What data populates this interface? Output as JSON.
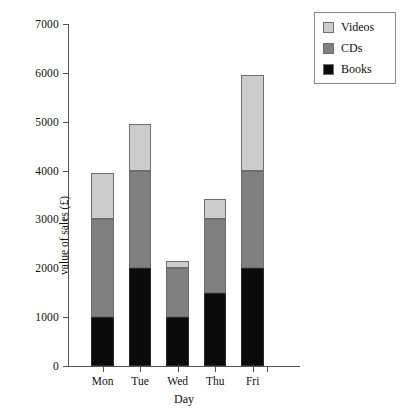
{
  "chart_data": {
    "type": "bar",
    "subtype": "stacked-bar",
    "title": "",
    "xlabel": "Day",
    "ylabel": "value of sales (£)",
    "categories": [
      "Mon",
      "Tue",
      "Wed",
      "Thu",
      "Fri"
    ],
    "ylim": [
      0,
      7000
    ],
    "yticks": [
      0,
      1000,
      2000,
      3000,
      4000,
      5000,
      6000,
      7000
    ],
    "ytick_labels": [
      "0",
      "1000",
      "2000",
      "3000",
      "4000",
      "5000",
      "6000",
      "7000"
    ],
    "grid": false,
    "legend_position": "top-right",
    "stack_order_bottom_to_top": [
      "Books",
      "CDs",
      "Videos"
    ],
    "series": [
      {
        "name": "Books",
        "color": "#0b0b0b",
        "values": [
          1000,
          2000,
          1000,
          1500,
          2000
        ]
      },
      {
        "name": "CDs",
        "color": "#808080",
        "values": [
          2000,
          2000,
          1000,
          1500,
          2000
        ]
      },
      {
        "name": "Videos",
        "color": "#cccccc",
        "values": [
          950,
          950,
          150,
          420,
          1950
        ]
      }
    ],
    "totals": [
      3950,
      4950,
      2150,
      3420,
      5950
    ]
  },
  "legend": {
    "entries": [
      {
        "label": "Videos",
        "color": "#cccccc"
      },
      {
        "label": "CDs",
        "color": "#808080"
      },
      {
        "label": "Books",
        "color": "#0b0b0b"
      }
    ]
  }
}
